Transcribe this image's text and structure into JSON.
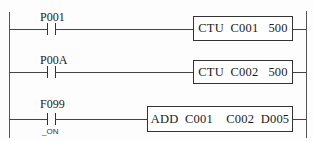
{
  "diagram": {
    "type": "ladder-logic",
    "rungs": [
      {
        "contact": {
          "label": "P001",
          "sublabel": ""
        },
        "instruction": {
          "text": "CTU  C001   500",
          "opcode": "CTU",
          "operands": [
            "C001",
            "500"
          ]
        }
      },
      {
        "contact": {
          "label": "P00A",
          "sublabel": ""
        },
        "instruction": {
          "text": "CTU  C002   500",
          "opcode": "CTU",
          "operands": [
            "C002",
            "500"
          ]
        }
      },
      {
        "contact": {
          "label": "F099",
          "sublabel": "_ON"
        },
        "instruction": {
          "text": "ADD  C001    C002  D005",
          "opcode": "ADD",
          "operands": [
            "C001",
            "C002",
            "D005"
          ]
        }
      }
    ]
  },
  "colors": {
    "line": "#444444",
    "text": "#1a1a1a",
    "background": "#fdfdfd"
  }
}
